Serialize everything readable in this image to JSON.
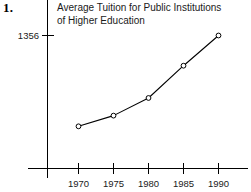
{
  "figure": {
    "problem_number": "1.",
    "background_color": "#ffffff",
    "ink_color": "#000000"
  },
  "chart_data": {
    "type": "line",
    "title": "Average Tuition for Public Institutions\nof Higher Education",
    "title_line_1": "Average Tuition for Public Institutions",
    "title_line_2": "of Higher Education",
    "xlabel": "",
    "ylabel": "",
    "categories": [
      "1970",
      "1975",
      "1980",
      "1985",
      "1990"
    ],
    "x": [
      1970,
      1975,
      1980,
      1985,
      1990
    ],
    "values": [
      430,
      539,
      719,
      1048,
      1356
    ],
    "series": [
      {
        "name": "Average Tuition",
        "values": [
          430,
          539,
          719,
          1048,
          1356
        ],
        "marker": "open-circle",
        "color": "#000000"
      }
    ],
    "x_tick_labels": [
      "1970",
      "1975",
      "1980",
      "1985",
      "1990"
    ],
    "y_tick_labels": [
      "1356"
    ],
    "y_tick_values": [
      1356
    ],
    "xlim": [
      1967.5,
      1992.5
    ],
    "ylim": [
      0,
      1500
    ],
    "grid": false,
    "legend": false,
    "legend_position": "none",
    "annotations": []
  },
  "axes": {
    "y_axis_label_1356": "1356",
    "x_tick_1970": "1970",
    "x_tick_1975": "1975",
    "x_tick_1980": "1980",
    "x_tick_1985": "1985",
    "x_tick_1990": "1990"
  }
}
